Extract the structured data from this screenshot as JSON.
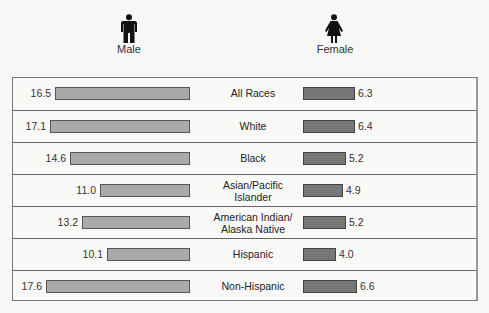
{
  "headers": {
    "male": "Male",
    "female": "Female"
  },
  "icons": {
    "male": "male-figure-icon",
    "female": "female-figure-icon"
  },
  "colors": {
    "male_bar": "#a9a9a9",
    "female_bar": "#777777",
    "border": "#666666"
  },
  "rows": [
    {
      "label": "All Races",
      "label_lines": [
        "All Races"
      ],
      "male": "16.5",
      "female": "6.3"
    },
    {
      "label": "White",
      "label_lines": [
        "White"
      ],
      "male": "17.1",
      "female": "6.4"
    },
    {
      "label": "Black",
      "label_lines": [
        "Black"
      ],
      "male": "14.6",
      "female": "5.2"
    },
    {
      "label": "Asian/Pacific Islander",
      "label_lines": [
        "Asian/Pacific",
        "Islander"
      ],
      "male": "11.0",
      "female": "4.9"
    },
    {
      "label": "American Indian/ Alaska Native",
      "label_lines": [
        "American Indian/",
        "Alaska Native"
      ],
      "male": "13.2",
      "female": "5.2"
    },
    {
      "label": "Hispanic",
      "label_lines": [
        "Hispanic"
      ],
      "male": "10.1",
      "female": "4.0"
    },
    {
      "label": "Non-Hispanic",
      "label_lines": [
        "Non-Hispanic"
      ],
      "male": "17.6",
      "female": "6.6"
    }
  ],
  "chart_data": {
    "type": "bar",
    "orientation": "horizontal-butterfly",
    "title": "",
    "categories": [
      "All Races",
      "White",
      "Black",
      "Asian/Pacific Islander",
      "American Indian/Alaska Native",
      "Hispanic",
      "Non-Hispanic"
    ],
    "series": [
      {
        "name": "Male",
        "values": [
          16.5,
          17.1,
          14.6,
          11.0,
          13.2,
          10.1,
          17.6
        ],
        "color": "#a9a9a9",
        "direction": "left"
      },
      {
        "name": "Female",
        "values": [
          6.3,
          6.4,
          5.2,
          4.9,
          5.2,
          4.0,
          6.6
        ],
        "color": "#777777",
        "direction": "right"
      }
    ],
    "xlabel": "",
    "ylabel": "",
    "grid": false,
    "legend": "icons above columns (Male left, Female right)",
    "data_labels": true
  }
}
